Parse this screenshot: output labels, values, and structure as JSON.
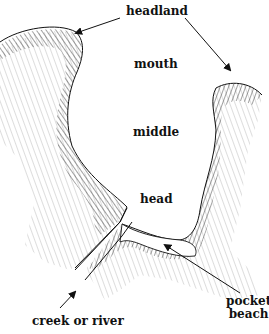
{
  "diagram": {
    "labels": {
      "headland": "headland",
      "mouth": "mouth",
      "middle": "middle",
      "head": "head",
      "creek": "creek or river",
      "pocket_beach_line1": "pocket",
      "pocket_beach_line2": "beach"
    },
    "colors": {
      "ink": "#111111",
      "hatch": "#333333",
      "background": "#ffffff"
    }
  }
}
